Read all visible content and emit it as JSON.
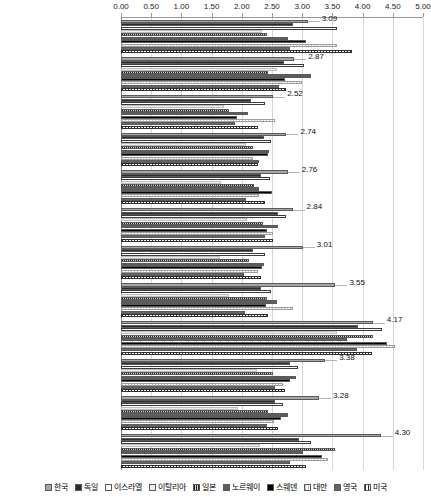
{
  "chart_data": {
    "type": "bar",
    "orientation": "horizontal",
    "title": "",
    "xlabel": "",
    "ylabel": "",
    "xlim": [
      0.0,
      5.0
    ],
    "xticks": [
      "0.00",
      "0.50",
      "1.00",
      "1.50",
      "2.00",
      "2.50",
      "3.00",
      "3.50",
      "4.00",
      "4.50",
      "5.00"
    ],
    "grid": true,
    "legend_position": "bottom",
    "categories": [
      "문화사회 규범",
      "상업 및 전문가 인프라",
      "학교 단계의 기업가교육",
      "내부시장 개방성",
      "R&D 이전",
      "학교교육 이후 단계의 기업가교육",
      "정부정책-조세 및 관료제",
      "정부정책-지원",
      "물적 서비스 인프라",
      "정부정책 프로그램",
      "기업가적 금융",
      "내부시장 역동성"
    ],
    "annotations": [
      "3.09",
      "2.87",
      "2.52",
      "2.74",
      "2.76",
      "2.84",
      "3.01",
      "3.55",
      "4.17",
      "3.38",
      "3.28",
      "4.30"
    ],
    "series": [
      {
        "name": "한국",
        "values": [
          3.09,
          2.87,
          2.52,
          2.74,
          2.76,
          2.84,
          3.01,
          3.55,
          4.17,
          3.38,
          3.28,
          4.3
        ]
      },
      {
        "name": "독일",
        "values": [
          2.85,
          2.7,
          2.16,
          2.37,
          2.31,
          2.6,
          2.19,
          2.31,
          3.92,
          2.8,
          2.55,
          2.94
        ]
      },
      {
        "name": "이스라엘",
        "values": [
          3.58,
          3.03,
          2.39,
          2.49,
          2.47,
          2.74,
          2.39,
          2.48,
          4.32,
          2.93,
          2.68,
          3.14
        ]
      },
      {
        "name": "이탈리아",
        "values": [
          2.34,
          2.58,
          1.7,
          2.07,
          1.66,
          2.09,
          1.64,
          1.78,
          3.58,
          2.25,
          1.94,
          2.3
        ]
      },
      {
        "name": "일본",
        "values": [
          2.41,
          2.43,
          1.78,
          2.18,
          2.2,
          2.35,
          2.12,
          2.42,
          4.17,
          2.52,
          2.43,
          3.55
        ]
      },
      {
        "name": "노르웨이",
        "values": [
          2.77,
          3.14,
          2.1,
          2.45,
          2.28,
          2.6,
          2.37,
          2.58,
          3.74,
          2.9,
          2.77,
          3.02
        ],
        "inner": true
      },
      {
        "name": "스웨덴",
        "values": [
          3.06,
          2.72,
          1.92,
          2.43,
          2.5,
          2.41,
          2.33,
          2.4,
          4.4,
          2.8,
          2.65,
          3.32
        ]
      },
      {
        "name": "대만",
        "values": [
          3.57,
          3.0,
          2.55,
          2.18,
          2.28,
          2.51,
          2.27,
          2.84,
          4.54,
          2.69,
          2.53,
          3.42
        ]
      },
      {
        "name": "영국",
        "values": [
          2.79,
          2.61,
          1.88,
          2.28,
          2.07,
          2.38,
          2.03,
          2.05,
          3.9,
          2.55,
          2.41,
          2.8
        ]
      },
      {
        "name": "미국",
        "values": [
          3.83,
          2.74,
          2.27,
          2.27,
          2.39,
          2.52,
          2.31,
          2.44,
          4.15,
          2.72,
          2.6,
          3.06
        ]
      }
    ]
  },
  "legend": {
    "items": [
      {
        "label": "한국",
        "swatch": "s0"
      },
      {
        "label": "독일",
        "swatch": "s1"
      },
      {
        "label": "이스라엘",
        "swatch": "s2"
      },
      {
        "label": "이탈리아",
        "swatch": "s3"
      },
      {
        "label": "일본",
        "swatch": "s4"
      },
      {
        "label": "노르웨이",
        "swatch": "s5"
      },
      {
        "label": "스웨덴",
        "swatch": "s6"
      },
      {
        "label": "대만",
        "swatch": "s7"
      },
      {
        "label": "영국",
        "swatch": "s8"
      },
      {
        "label": "미국",
        "swatch": "s9"
      }
    ]
  }
}
